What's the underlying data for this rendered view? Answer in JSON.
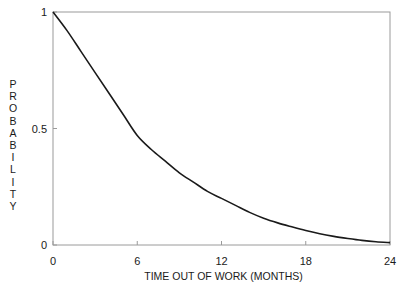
{
  "chart_data": {
    "type": "line",
    "title": "",
    "xlabel": "TIME OUT OF WORK (MONTHS)",
    "ylabel": "PROBABILITY",
    "xlim": [
      0,
      24
    ],
    "ylim": [
      0,
      1
    ],
    "x_ticks": [
      0,
      6,
      12,
      18,
      24
    ],
    "x_tick_labels": [
      "0",
      "6",
      "12",
      "18",
      "24"
    ],
    "y_ticks": [
      0,
      0.5,
      1
    ],
    "y_tick_labels": [
      "0",
      "0.5",
      "1"
    ],
    "grid": false,
    "legend": null,
    "series": [
      {
        "name": "probability",
        "x": [
          0,
          1,
          2,
          3,
          4,
          5,
          6,
          7,
          8,
          9,
          10,
          11,
          12,
          13,
          14,
          15,
          16,
          17,
          18,
          19,
          20,
          21,
          22,
          23,
          24
        ],
        "values": [
          1.0,
          0.92,
          0.83,
          0.74,
          0.65,
          0.56,
          0.47,
          0.41,
          0.36,
          0.31,
          0.27,
          0.23,
          0.2,
          0.17,
          0.14,
          0.115,
          0.095,
          0.078,
          0.062,
          0.048,
          0.037,
          0.028,
          0.02,
          0.014,
          0.01
        ]
      }
    ],
    "colors": {
      "line": "#1a1a1a",
      "frame": "#9a9a9a"
    }
  }
}
